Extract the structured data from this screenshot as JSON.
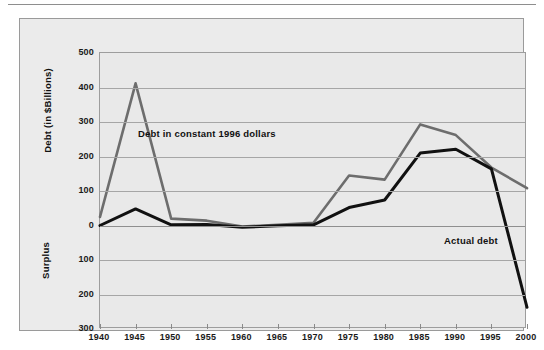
{
  "figure": {
    "background_color": "#ebebeb",
    "plot_background_color": "#e9e9e9",
    "border_color": "#9a9a9a"
  },
  "axes": {
    "y_upper_title": "Debt (in $Billions)",
    "y_lower_title": "Surplus",
    "y_tick_labels": [
      "500",
      "400",
      "300",
      "200",
      "100",
      "0",
      "100",
      "200",
      "300"
    ],
    "x_tick_labels": [
      "1940",
      "1945",
      "1950",
      "1955",
      "1960",
      "1965",
      "1970",
      "1975",
      "1980",
      "1985",
      "1990",
      "1995",
      "2000"
    ]
  },
  "annotations": {
    "constant_dollars": "Debt in constant 1996 dollars",
    "actual_debt": "Actual debt"
  },
  "chart_data": {
    "type": "line",
    "title": "",
    "xlabel": "",
    "ylabel": "Debt (in $Billions)",
    "xlim": [
      1940,
      2000
    ],
    "ylim": [
      -300,
      500
    ],
    "grid": true,
    "legend": "inline-annotations",
    "x": [
      1940,
      1945,
      1950,
      1955,
      1960,
      1965,
      1970,
      1975,
      1980,
      1985,
      1990,
      1995,
      2000
    ],
    "series": [
      {
        "name": "Debt in constant 1996 dollars",
        "color": "#6d6d6d",
        "width": 2.6,
        "values": [
          25,
          412,
          20,
          14,
          -3,
          2,
          8,
          145,
          133,
          293,
          262,
          168,
          108
        ]
      },
      {
        "name": "Actual debt",
        "color": "#111111",
        "width": 3.0,
        "values": [
          0,
          48,
          2,
          3,
          -5,
          -1,
          2,
          52,
          74,
          210,
          221,
          164,
          -237
        ]
      }
    ]
  }
}
